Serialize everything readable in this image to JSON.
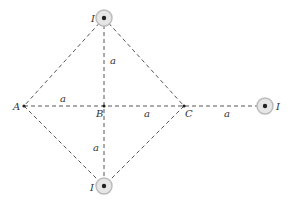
{
  "diagram": {
    "type": "geometry-current-wires",
    "points": {
      "A": {
        "label": "A",
        "x": 24,
        "y": 106
      },
      "B": {
        "label": "B",
        "x": 104,
        "y": 106
      },
      "C": {
        "label": "C",
        "x": 184,
        "y": 106
      }
    },
    "wires": [
      {
        "id": "top",
        "label": "I",
        "x": 104,
        "y": 18
      },
      {
        "id": "bottom",
        "label": "I",
        "x": 104,
        "y": 186
      },
      {
        "id": "right",
        "label": "I",
        "x": 265,
        "y": 106
      }
    ],
    "distances": {
      "top_to_B": "a",
      "A_to_B": "a",
      "B_to_C": "a",
      "C_to_right": "a",
      "B_to_bottom": "a"
    },
    "colors": {
      "line": "#444444",
      "wire_halo": "#d0d0d0",
      "wire_core": "#222222"
    }
  }
}
